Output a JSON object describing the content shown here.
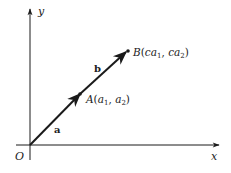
{
  "diagram": {
    "type": "vector-scalar-multiple",
    "colors": {
      "ink": "#1a1a1a",
      "background": "#ffffff"
    },
    "axes": {
      "x_label": "x",
      "y_label": "y",
      "origin_label": "O"
    },
    "vectors": [
      {
        "name": "a",
        "label": "a",
        "from": "O",
        "to": "A"
      },
      {
        "name": "b",
        "label": "b",
        "from": "A",
        "to": "B"
      }
    ],
    "points": {
      "A": {
        "name": "A",
        "open": "(",
        "x": "a",
        "x_sub": "1",
        "sep": ", ",
        "y": "a",
        "y_sub": "2",
        "close": ")"
      },
      "B": {
        "name": "B",
        "open": "(",
        "x": "ca",
        "x_sub": "1",
        "sep": ", ",
        "y": "ca",
        "y_sub": "2",
        "close": ")"
      }
    }
  }
}
